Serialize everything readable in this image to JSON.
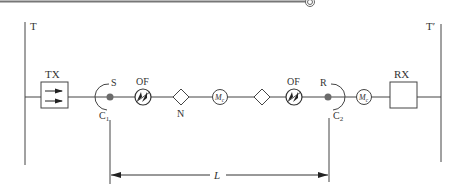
{
  "diagram": {
    "colors": {
      "line": "#444444",
      "dot": "#6b6b6b",
      "header_rule": "#888888"
    },
    "labels": {
      "left_terminal": "T",
      "right_terminal": "T′",
      "transmitter": "TX",
      "receiver": "RX",
      "source_point": "S",
      "receive_point": "R",
      "connector_1_main": "C",
      "connector_1_sub": "1",
      "connector_2_main": "C",
      "connector_2_sub": "2",
      "fiber_1": "OF",
      "fiber_2": "OF",
      "node": "N",
      "mux_1_main": "M",
      "mux_1_sub": "c",
      "mux_2_main": "M",
      "mux_2_sub": "c",
      "length": "L"
    },
    "components": [
      {
        "id": "T",
        "type": "terminal-bar"
      },
      {
        "id": "TX",
        "type": "transmitter-box"
      },
      {
        "id": "C1",
        "type": "connector"
      },
      {
        "id": "S",
        "type": "point"
      },
      {
        "id": "OF1",
        "type": "optical-fiber"
      },
      {
        "id": "N",
        "type": "node-diamond"
      },
      {
        "id": "Mc1",
        "type": "circle-element"
      },
      {
        "id": "diamond2",
        "type": "node-diamond"
      },
      {
        "id": "OF2",
        "type": "optical-fiber"
      },
      {
        "id": "R",
        "type": "point"
      },
      {
        "id": "C2",
        "type": "connector"
      },
      {
        "id": "Mc2",
        "type": "circle-element"
      },
      {
        "id": "RX",
        "type": "receiver-box"
      },
      {
        "id": "T'",
        "type": "terminal-bar"
      }
    ]
  }
}
